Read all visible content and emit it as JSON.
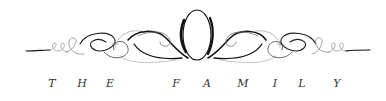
{
  "logo": {
    "monogram": "O",
    "tagline_letters": [
      {
        "char": "T",
        "x": 52
      },
      {
        "char": "H",
        "x": 82
      },
      {
        "char": "E",
        "x": 110
      },
      {
        "char": "F",
        "x": 176
      },
      {
        "char": "A",
        "x": 207
      },
      {
        "char": "M",
        "x": 243
      },
      {
        "char": "I",
        "x": 275
      },
      {
        "char": "L",
        "x": 302
      },
      {
        "char": "Y",
        "x": 337
      }
    ],
    "tagline": "THE FAMILY",
    "colors": {
      "ink": "#111111",
      "light_ink": "#8a8a8a",
      "background": "#ffffff"
    }
  }
}
